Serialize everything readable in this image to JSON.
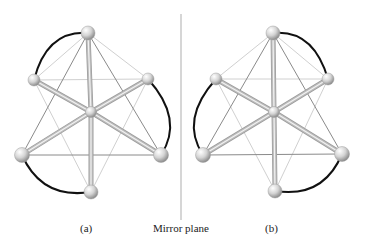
{
  "figure": {
    "labels": {
      "a": "(a)",
      "mirror": "Mirror plane",
      "b": "(b)"
    },
    "mirror_line": {
      "x": 181,
      "y1": 14,
      "y2": 220,
      "color": "#c8c8c8"
    },
    "colors": {
      "bond_thick": "#bdbdbd",
      "bond_thick_highlight": "#f2f2f2",
      "bond_thin": "#8a8a8a",
      "bond_thin_light": "#d0d0d0",
      "arc": "#111111",
      "atom_light": "#ffffff",
      "atom_dark": "#9a9a9a"
    },
    "molecules": [
      {
        "name": "a",
        "center": [
          91,
          112
        ],
        "atoms": {
          "top": [
            88,
            33
          ],
          "back_left": [
            34,
            80
          ],
          "back_right": [
            148,
            79
          ],
          "front_left": [
            22,
            155
          ],
          "front_right": [
            161,
            155
          ],
          "bottom": [
            91,
            192
          ]
        },
        "arcs": [
          [
            "top",
            "back_left"
          ],
          [
            "back_right",
            "front_right"
          ],
          [
            "front_left",
            "bottom"
          ]
        ]
      },
      {
        "name": "b",
        "center": [
          274,
          112
        ],
        "atoms": {
          "top": [
            273,
            33
          ],
          "back_left": [
            216,
            79
          ],
          "back_right": [
            328,
            79
          ],
          "front_left": [
            203,
            155
          ],
          "front_right": [
            342,
            154
          ],
          "bottom": [
            275,
            191
          ]
        },
        "arcs": [
          [
            "top",
            "back_right"
          ],
          [
            "back_left",
            "front_left"
          ],
          [
            "front_right",
            "bottom"
          ]
        ]
      }
    ]
  }
}
